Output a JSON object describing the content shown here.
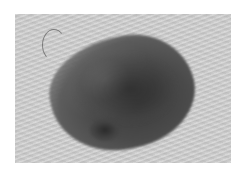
{
  "image": {
    "description": "Grayscale clinical photograph of a pigmented skin lesion on textured skin",
    "colors": {
      "background": "#ffffff",
      "skin": "#cfcfcf",
      "lesion_dark": "#3a3a3a"
    }
  }
}
